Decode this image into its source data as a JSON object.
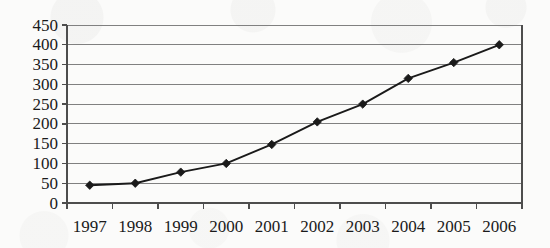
{
  "chart_data": {
    "type": "line",
    "title": "",
    "subtitle": "",
    "xlabel": "",
    "ylabel": "",
    "categories": [
      "1997",
      "1998",
      "1999",
      "2000",
      "2001",
      "2002",
      "2003",
      "2004",
      "2005",
      "2006"
    ],
    "values": [
      45,
      50,
      78,
      100,
      148,
      205,
      250,
      315,
      355,
      400
    ],
    "series": [
      {
        "name": "",
        "values": [
          45,
          50,
          78,
          100,
          148,
          205,
          250,
          315,
          355,
          400
        ]
      }
    ],
    "ylim": [
      0,
      450
    ],
    "ytick_step": 50,
    "yticks": [
      "0",
      "50",
      "100",
      "150",
      "200",
      "250",
      "300",
      "350",
      "400",
      "450"
    ],
    "xticks": [
      "1997",
      "1998",
      "1999",
      "2000",
      "2001",
      "2002",
      "2003",
      "2004",
      "2005",
      "2006"
    ],
    "grid": true,
    "grid_axis": "y",
    "legend": false,
    "legend_position": "none",
    "marker": "diamond",
    "line_color": "#1a1a1a",
    "marker_color": "#1a1a1a",
    "grid_color": "#808080",
    "axis_color": "#4d4d4d",
    "background_color": "#fbfbfa"
  },
  "axes": {
    "y_axis_name": "y-axis",
    "x_axis_name": "x-axis"
  }
}
